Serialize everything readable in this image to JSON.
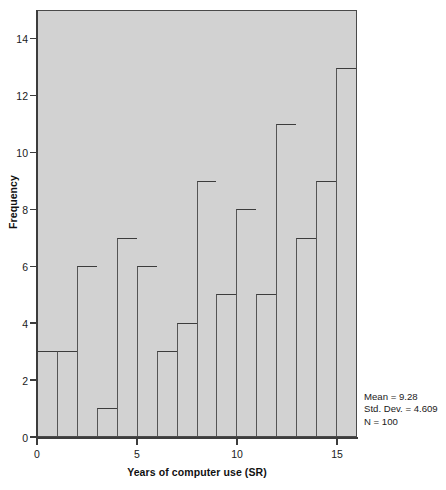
{
  "chart_data": {
    "type": "bar",
    "title": "",
    "xlabel": "Years of computer use (SR)",
    "ylabel": "Frequency",
    "bin_width": 1,
    "bin_edges": [
      0,
      1,
      2,
      3,
      4,
      5,
      6,
      7,
      8,
      9,
      10,
      11,
      12,
      13,
      14,
      15,
      16
    ],
    "categories": [
      "0-1",
      "1-2",
      "2-3",
      "3-4",
      "4-5",
      "5-6",
      "6-7",
      "7-8",
      "8-9",
      "9-10",
      "10-11",
      "11-12",
      "12-13",
      "13-14",
      "14-15",
      "15-16"
    ],
    "values": [
      3,
      3,
      6,
      1,
      7,
      6,
      3,
      4,
      9,
      5,
      8,
      5,
      11,
      7,
      9,
      13
    ],
    "xlim": [
      0,
      16
    ],
    "ylim": [
      0,
      15
    ],
    "y_ticks": [
      0,
      2,
      4,
      6,
      8,
      10,
      12,
      14
    ],
    "y_tick_labels": [
      "0",
      "2",
      "4",
      "6",
      "8",
      "10",
      "12",
      "14"
    ],
    "x_ticks": [
      0,
      5,
      10,
      15
    ],
    "x_tick_labels": [
      "0",
      "5",
      "10",
      "15"
    ],
    "grid": false,
    "legend": false,
    "plot_background_color": "#d2d2d2",
    "bar_outline_color": "#3c3c3c",
    "figure_background_color": "#ffffff"
  },
  "statistics": {
    "mean_label": "Mean = 9.28",
    "std_dev_label": "Std. Dev. = 4.609",
    "n_label": "N = 100"
  }
}
